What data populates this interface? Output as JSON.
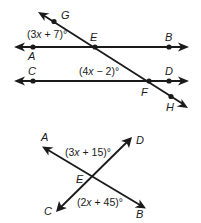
{
  "figure1": {
    "type": "parallel-lines-cut-by-transversal",
    "lines": [
      {
        "name": "AB",
        "points": [
          "A",
          "E",
          "B"
        ]
      },
      {
        "name": "CD",
        "points": [
          "C",
          "F",
          "D"
        ]
      },
      {
        "name": "GH",
        "points": [
          "G",
          "E",
          "F",
          "H"
        ],
        "role": "transversal"
      }
    ],
    "labels": {
      "G": "G",
      "E": "E",
      "B": "B",
      "A": "A",
      "C": "C",
      "D": "D",
      "F": "F",
      "H": "H"
    },
    "angles": [
      {
        "id": "angle-AEG",
        "expr_a": "(3",
        "var": "x",
        "expr_b": " + 7)°",
        "full": "(3x + 7)°"
      },
      {
        "id": "angle-CFE",
        "expr_a": "(4",
        "var": "x",
        "expr_b": " − 2)°",
        "full": "(4x − 2)°"
      }
    ]
  },
  "figure2": {
    "type": "intersecting-lines",
    "lines": [
      {
        "name": "AB",
        "points": [
          "A",
          "E",
          "B"
        ]
      },
      {
        "name": "CD",
        "points": [
          "C",
          "E",
          "D"
        ]
      }
    ],
    "labels": {
      "A": "A",
      "D": "D",
      "E": "E",
      "C": "C",
      "B": "B"
    },
    "angles": [
      {
        "id": "angle-AED",
        "expr_a": "(3",
        "var": "x",
        "expr_b": " + 15)°",
        "full": "(3x + 15)°"
      },
      {
        "id": "angle-CEB",
        "expr_a": "(2",
        "var": "x",
        "expr_b": " + 45)°",
        "full": "(2x + 45)°"
      }
    ]
  }
}
